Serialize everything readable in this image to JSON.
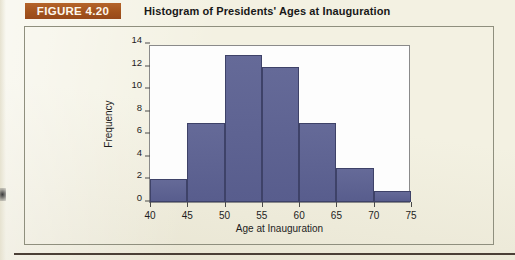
{
  "figure": {
    "badge_label": "FIGURE 4.20",
    "title": "Histogram of Presidents' Ages at Inauguration",
    "badge_color": "#a8561f",
    "page_background": "#f3f1e2",
    "rule_color": "#4b3f36"
  },
  "chart_data": {
    "type": "bar",
    "title": "Histogram of Presidents' Ages at Inauguration",
    "xlabel": "Age at Inauguration",
    "ylabel": "Frequency",
    "categories": [
      "40-45",
      "45-50",
      "50-55",
      "55-60",
      "60-65",
      "65-70",
      "70-75"
    ],
    "bin_edges": [
      40,
      45,
      50,
      55,
      60,
      65,
      70,
      75
    ],
    "values": [
      2,
      7,
      13,
      12,
      7,
      3,
      1
    ],
    "xlim": [
      40,
      75
    ],
    "ylim": [
      0,
      14
    ],
    "xticks": [
      40,
      45,
      50,
      55,
      60,
      65,
      70,
      75
    ],
    "yticks": [
      0,
      2,
      4,
      6,
      8,
      10,
      12,
      14
    ],
    "grid": false,
    "legend": null,
    "bar_color": "#5d6191",
    "bar_edge_color": "#3e4268",
    "panel_color": "#fdfdfd"
  }
}
